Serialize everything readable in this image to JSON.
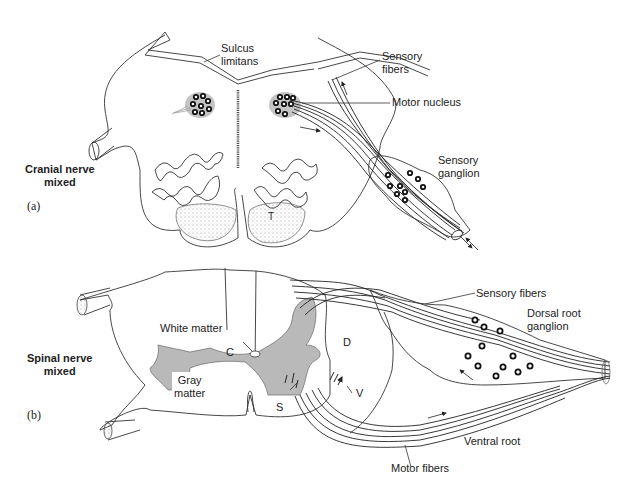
{
  "panel_a": {
    "caption": "(a)",
    "title_line1": "Cranial nerve",
    "title_line2": "mixed",
    "labels": {
      "sulcus_limitans_1": "Sulcus",
      "sulcus_limitans_2": "limitans",
      "sensory_fibers_1": "Sensory",
      "sensory_fibers_2": "fibers",
      "motor_nucleus": "Motor nucleus",
      "sensory_ganglion_1": "Sensory",
      "sensory_ganglion_2": "ganglion",
      "tract": "T"
    }
  },
  "panel_b": {
    "caption": "(b)",
    "title_line1": "Spinal nerve",
    "title_line2": "mixed",
    "labels": {
      "white_matter": "White matter",
      "gray_matter_1": "Gray",
      "gray_matter_2": "matter",
      "central_canal": "C",
      "dorsal_horn": "D",
      "ventral_horn": "V",
      "somatic": "S",
      "sensory_fibers": "Sensory fibers",
      "dorsal_root_ganglion_1": "Dorsal root",
      "dorsal_root_ganglion_2": "ganglion",
      "ventral_root": "Ventral root",
      "motor_fibers": "Motor fibers"
    }
  },
  "colors": {
    "gray_matter": "#b9b9b9",
    "outline": "#333333",
    "background": "#ffffff"
  }
}
